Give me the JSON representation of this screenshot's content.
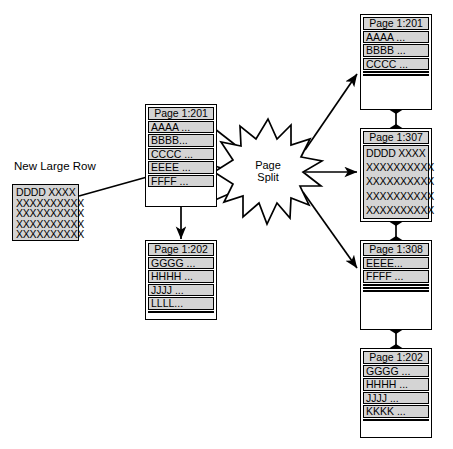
{
  "diagram": {
    "title": "Page Split",
    "caption_new_row": "New Large Row",
    "split_label": "Page\nSplit"
  },
  "new_large_row": {
    "name": "new-large-row-block",
    "lines": [
      "DDDD XXXX",
      "XXXXXXXXXX",
      "XXXXXXXXXX",
      "XXXXXXXXXX",
      "XXXXXXXXXX"
    ]
  },
  "before": {
    "pages": [
      {
        "header": "Page 1:201",
        "rows": [
          "AAAA ...",
          "BBBB...",
          "CCCC ...",
          "EEEE ...",
          "FFFF ..."
        ]
      },
      {
        "header": "Page 1:202",
        "rows": [
          "GGGG ...",
          "HHHH ...",
          "JJJJ ...",
          "LLLL...",
          ""
        ]
      }
    ]
  },
  "after": {
    "pages": [
      {
        "header": "Page 1:201",
        "rows": [
          "AAAA ...",
          "BBBB ...",
          "CCCC ...",
          "",
          ""
        ]
      },
      {
        "header": "Page 1:307",
        "monolithic": true,
        "lines": [
          "DDDD XXXX",
          "XXXXXXXXXX",
          "XXXXXXXXXX",
          "XXXXXXXXXX",
          "XXXXXXXXXX"
        ]
      },
      {
        "header": "Page 1:308",
        "rows": [
          "EEEE...",
          "FFFF ...",
          "",
          "",
          ""
        ]
      },
      {
        "header": "Page 1:202",
        "rows": [
          "GGGG ...",
          "HHHH ...",
          "JJJJ ...",
          "KKKK ...",
          ""
        ]
      }
    ]
  },
  "colors": {
    "row_fill": "#d4d4d4",
    "stroke": "#000000",
    "background": "#ffffff"
  }
}
